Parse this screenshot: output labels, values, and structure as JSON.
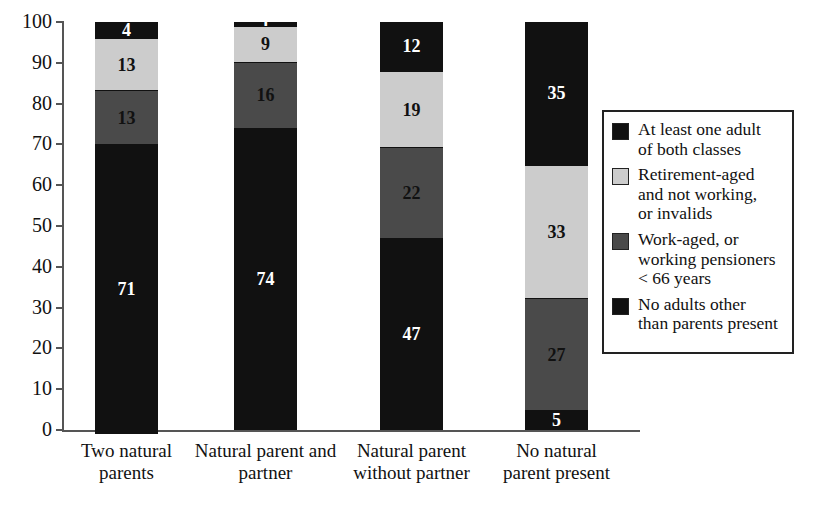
{
  "chart_data": {
    "type": "bar",
    "subtype": "stacked-bar-percent",
    "title": "",
    "xlabel": "",
    "ylabel": "",
    "ylim": [
      0,
      100
    ],
    "yticks": [
      0,
      10,
      20,
      30,
      40,
      50,
      60,
      70,
      80,
      90,
      100
    ],
    "ytick_labels": [
      "0",
      "10",
      "20",
      "30",
      "40",
      "50",
      "60",
      "70",
      "80",
      "90",
      "100"
    ],
    "grid": false,
    "legend_position": "right",
    "categories": [
      "Two natural\nparents",
      "Natural parent and\npartner",
      "Natural parent\nwithout partner",
      "No natural\nparent present"
    ],
    "series": [
      {
        "name": "No adults other than parents present",
        "color": "#111111",
        "text_color": "#ffffff",
        "values": [
          71,
          74,
          47,
          5
        ]
      },
      {
        "name": "Work-aged, or working pensioners < 66 years",
        "color": "#4a4a4a",
        "text_color": "#111111",
        "values": [
          13,
          16,
          22,
          27
        ]
      },
      {
        "name": "Retirement-aged and not working, or invalids",
        "color": "#cccccc",
        "text_color": "#111111",
        "values": [
          13,
          9,
          19,
          33
        ]
      },
      {
        "name": "At least one adult of both classes",
        "color": "#111111",
        "text_color": "#ffffff",
        "values": [
          4,
          1,
          12,
          35
        ]
      }
    ]
  },
  "legend": {
    "items": [
      {
        "swatch_color": "#111111",
        "label": "At least one adult\nof both classes"
      },
      {
        "swatch_color": "#cccccc",
        "label": "Retirement-aged\nand not working,\nor invalids"
      },
      {
        "swatch_color": "#4a4a4a",
        "label": "Work-aged, or\nworking pensioners\n< 66 years"
      },
      {
        "swatch_color": "#111111",
        "label": "No adults other\nthan parents present"
      }
    ]
  },
  "axis": {
    "y_labels": [
      "100",
      "90",
      "80",
      "70",
      "60",
      "50",
      "40",
      "30",
      "20",
      "10",
      "0"
    ]
  },
  "bars": [
    {
      "category": "Two natural\nparents",
      "segments": [
        {
          "value": "4",
          "color": "#111111",
          "text_color": "#ffffff"
        },
        {
          "value": "13",
          "color": "#cccccc",
          "text_color": "#111111"
        },
        {
          "value": "13",
          "color": "#4a4a4a",
          "text_color": "#111111"
        },
        {
          "value": "71",
          "color": "#111111",
          "text_color": "#ffffff"
        }
      ]
    },
    {
      "category": "Natural parent and\npartner",
      "segments": [
        {
          "value": "1",
          "color": "#111111",
          "text_color": "#ffffff"
        },
        {
          "value": "9",
          "color": "#cccccc",
          "text_color": "#111111"
        },
        {
          "value": "16",
          "color": "#4a4a4a",
          "text_color": "#111111"
        },
        {
          "value": "74",
          "color": "#111111",
          "text_color": "#ffffff"
        }
      ]
    },
    {
      "category": "Natural parent\nwithout partner",
      "segments": [
        {
          "value": "12",
          "color": "#111111",
          "text_color": "#ffffff"
        },
        {
          "value": "19",
          "color": "#cccccc",
          "text_color": "#111111"
        },
        {
          "value": "22",
          "color": "#4a4a4a",
          "text_color": "#111111"
        },
        {
          "value": "47",
          "color": "#111111",
          "text_color": "#ffffff"
        }
      ]
    },
    {
      "category": "No natural\nparent present",
      "segments": [
        {
          "value": "35",
          "color": "#111111",
          "text_color": "#ffffff"
        },
        {
          "value": "33",
          "color": "#cccccc",
          "text_color": "#111111"
        },
        {
          "value": "27",
          "color": "#4a4a4a",
          "text_color": "#111111"
        },
        {
          "value": "5",
          "color": "#111111",
          "text_color": "#ffffff"
        }
      ]
    }
  ]
}
